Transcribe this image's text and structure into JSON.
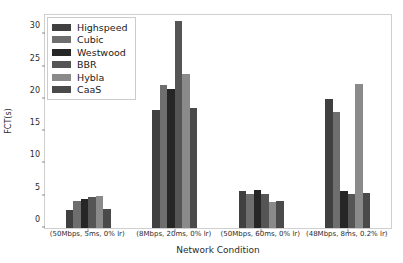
{
  "chart_data": {
    "type": "bar",
    "title": "",
    "subtitle": "",
    "xlabel": "Network Condition",
    "ylabel": "FCT(s)",
    "categories": [
      "(50Mbps, 5ms, 0% lr)",
      "(8Mbps, 20ms, 0% lr)",
      "(50Mbps, 60ms, 0% lr)",
      "(48Mbps, 8ms, 0.2% lr)"
    ],
    "series": [
      {
        "name": "Highspeed",
        "color": "#404040",
        "values": [
          2.8,
          18.3,
          5.8,
          20.0
        ]
      },
      {
        "name": "Cubic",
        "color": "#6e6e6e",
        "values": [
          4.2,
          22.2,
          5.3,
          17.9
        ]
      },
      {
        "name": "Westwood",
        "color": "#262626",
        "values": [
          4.5,
          21.6,
          5.9,
          5.8
        ]
      },
      {
        "name": "BBR",
        "color": "#555555",
        "values": [
          4.8,
          32.0,
          5.2,
          5.2
        ]
      },
      {
        "name": "Hybla",
        "color": "#8a8a8a",
        "values": [
          4.9,
          23.8,
          4.0,
          22.3
        ]
      },
      {
        "name": "CaaS",
        "color": "#4a4a4a",
        "values": [
          2.9,
          18.6,
          4.2,
          5.4
        ]
      }
    ],
    "ylim": [
      0,
      33.0
    ],
    "yticks": [
      0,
      5,
      10,
      15,
      20,
      25,
      30
    ],
    "ytick_labels": [
      "0",
      "5",
      "10",
      "15",
      "20",
      "25",
      "30"
    ],
    "xlim": [
      0,
      4
    ],
    "grid": false,
    "legend_position": "upper left",
    "legend_entries": [
      "Highspeed",
      "Cubic",
      "Westwood",
      "BBR",
      "Hybla",
      "CaaS"
    ]
  }
}
